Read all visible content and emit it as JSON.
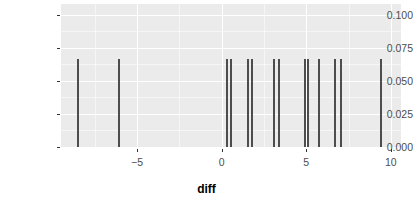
{
  "chart_data": {
    "type": "bar",
    "title": "",
    "subtitle": "",
    "xlabel": "diff",
    "ylabel": "",
    "xlim": [
      -9.5,
      10.6
    ],
    "ylim": [
      0.0,
      0.108
    ],
    "grid": true,
    "legend": null,
    "bar_height": 0.0667,
    "x_ticks": [
      {
        "value": -5,
        "label": "−5"
      },
      {
        "value": 0,
        "label": "0"
      },
      {
        "value": 5,
        "label": "5"
      },
      {
        "value": 10,
        "label": "10"
      }
    ],
    "x_minor_ticks": [
      -7.5,
      -2.5,
      2.5,
      7.5
    ],
    "y_ticks": [
      {
        "value": 0.0,
        "label": "0.000"
      },
      {
        "value": 0.025,
        "label": "0.025"
      },
      {
        "value": 0.05,
        "label": "0.050"
      },
      {
        "value": 0.075,
        "label": "0.075"
      },
      {
        "value": 0.1,
        "label": "0.100"
      }
    ],
    "y_minor_ticks": [
      0.0125,
      0.0375,
      0.0625,
      0.0875
    ],
    "values": [
      -8.5,
      -6.1,
      0.3,
      0.55,
      1.55,
      1.8,
      3.1,
      3.4,
      4.9,
      5.1,
      5.75,
      6.7,
      7.05,
      9.4
    ],
    "heights": [
      0.0667,
      0.0667,
      0.0667,
      0.0667,
      0.0667,
      0.0667,
      0.0667,
      0.0667,
      0.0667,
      0.0667,
      0.0667,
      0.0667,
      0.0667,
      0.0667
    ],
    "colors": {
      "panel_background": "#ebebeb",
      "grid": "#ffffff",
      "bar": "#4d4d4d",
      "axis_text": "#4d4d4d",
      "axis_title": "#000000",
      "page_background": "#ffffff"
    }
  }
}
